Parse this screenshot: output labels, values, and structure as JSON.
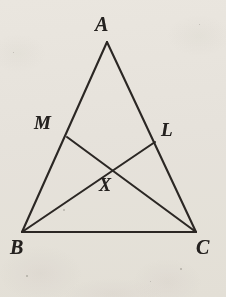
{
  "figure": {
    "kind": "euclidean-geometry-diagram",
    "canvas": {
      "width": 226,
      "height": 297
    },
    "background_color": "#f3f1ed",
    "stroke_color": "#2b2724",
    "stroke_width": 2.1,
    "label_color": "#24211f",
    "points": [
      {
        "id": "A",
        "label": "A",
        "x": 107,
        "y": 42,
        "label_x": 95,
        "label_y": 14,
        "font_size": 20
      },
      {
        "id": "B",
        "label": "B",
        "x": 22,
        "y": 232,
        "label_x": 10,
        "label_y": 237,
        "font_size": 20
      },
      {
        "id": "C",
        "label": "C",
        "x": 196,
        "y": 232,
        "label_x": 196,
        "label_y": 237,
        "font_size": 20
      },
      {
        "id": "M",
        "label": "M",
        "x": 67,
        "y": 137,
        "label_x": 34,
        "label_y": 113,
        "font_size": 19
      },
      {
        "id": "L",
        "label": "L",
        "x": 155,
        "y": 142,
        "label_x": 161,
        "label_y": 120,
        "font_size": 19
      },
      {
        "id": "X",
        "label": "X",
        "x": 110,
        "y": 168,
        "label_x": 99,
        "label_y": 176,
        "font_size": 18
      }
    ],
    "segments": [
      {
        "id": "AB",
        "from": "A",
        "to": "B",
        "name": "side-ab"
      },
      {
        "id": "AC",
        "from": "A",
        "to": "C",
        "name": "side-ac"
      },
      {
        "id": "BC",
        "from": "B",
        "to": "C",
        "name": "side-bc"
      },
      {
        "id": "MC",
        "from": "M",
        "to": "C",
        "name": "cevian-mc"
      },
      {
        "id": "LB",
        "from": "L",
        "to": "B",
        "name": "cevian-lb"
      }
    ],
    "specks": [
      {
        "x": 63,
        "y": 209,
        "size": 2.0
      },
      {
        "x": 180,
        "y": 268,
        "size": 1.6
      },
      {
        "x": 26,
        "y": 275,
        "size": 1.5
      },
      {
        "x": 150,
        "y": 281,
        "size": 1.4
      },
      {
        "x": 199,
        "y": 24,
        "size": 1.3
      },
      {
        "x": 13,
        "y": 52,
        "size": 1.3
      }
    ]
  }
}
